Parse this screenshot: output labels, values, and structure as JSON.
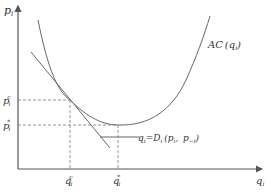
{
  "diagram": {
    "y_axis_label": "p",
    "y_axis_sub": "i",
    "x_axis_label": "q",
    "x_axis_sub": "i",
    "ac_curve_label": "AC (q",
    "ac_curve_sub": "i",
    "ac_curve_close": ")",
    "demand_label_q": "q",
    "demand_label_sub": "i",
    "demand_label_eq": "=D",
    "demand_label_sub2": "i",
    "demand_label_args": " (p",
    "demand_label_sub3": "i",
    "demand_label_mid": ",  p",
    "demand_label_sub4": "−i",
    "demand_label_close": ")",
    "p_c_label": "p",
    "p_c_sub": "i",
    "p_c_sup": "c",
    "p_star_label": "p",
    "p_star_sub": "i",
    "p_star_sup": "*",
    "q_c_label": "q",
    "q_c_sub": "i",
    "q_c_sup": "c",
    "q_star_label": "q",
    "q_star_sub": "i",
    "q_star_sup": "*",
    "colors": {
      "axis": "#555555",
      "curve": "#666666",
      "dashed": "#777777",
      "text": "#333333"
    }
  }
}
